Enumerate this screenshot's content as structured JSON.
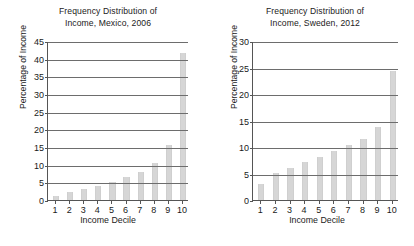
{
  "figure": {
    "background_color": "#ffffff",
    "bar_color": "#d6d6d6",
    "axis_color": "#555555",
    "gridline_color": "#6d6d6d"
  },
  "charts": [
    {
      "id": "mexico",
      "title_line1": "Frequency Distribution of",
      "title_line2": "Income, Mexico, 2006",
      "xlabel": "Income Decile",
      "ylabel": "Percentage of Income",
      "ytick_labels": [
        "0",
        "5",
        "10",
        "15",
        "20",
        "25",
        "30",
        "35",
        "40",
        "45"
      ],
      "xtick_labels": [
        "1",
        "2",
        "3",
        "4",
        "5",
        "6",
        "7",
        "8",
        "9",
        "10"
      ]
    },
    {
      "id": "sweden",
      "title_line1": "Frequency Distribution of",
      "title_line2": "Income, Sweden, 2012",
      "xlabel": "Income Decile",
      "ylabel": "Percentage of Income",
      "ytick_labels": [
        "0",
        "5",
        "10",
        "15",
        "20",
        "25",
        "30"
      ],
      "xtick_labels": [
        "1",
        "2",
        "3",
        "4",
        "5",
        "6",
        "7",
        "8",
        "9",
        "10"
      ]
    }
  ],
  "chart_data": [
    {
      "type": "bar",
      "title": "Frequency Distribution of Income, Mexico, 2006",
      "xlabel": "Income Decile",
      "ylabel": "Percentage of Income",
      "categories": [
        "1",
        "2",
        "3",
        "4",
        "5",
        "6",
        "7",
        "8",
        "9",
        "10"
      ],
      "values": [
        1.2,
        2.3,
        3.2,
        4.1,
        5.2,
        6.5,
        7.8,
        10.5,
        15.6,
        41.5
      ],
      "ylim": [
        0,
        45
      ],
      "yticks": [
        0,
        5,
        10,
        15,
        20,
        25,
        30,
        35,
        40,
        45
      ],
      "grid": true,
      "legend": "none"
    },
    {
      "type": "bar",
      "title": "Frequency Distribution of Income, Sweden, 2012",
      "xlabel": "Income Decile",
      "ylabel": "Percentage of Income",
      "categories": [
        "1",
        "2",
        "3",
        "4",
        "5",
        "6",
        "7",
        "8",
        "9",
        "10"
      ],
      "values": [
        3.0,
        5.1,
        6.1,
        7.2,
        8.1,
        9.2,
        10.3,
        11.6,
        13.8,
        24.3
      ],
      "ylim": [
        0,
        30
      ],
      "yticks": [
        0,
        5,
        10,
        15,
        20,
        25,
        30
      ],
      "grid": true,
      "legend": "none"
    }
  ]
}
